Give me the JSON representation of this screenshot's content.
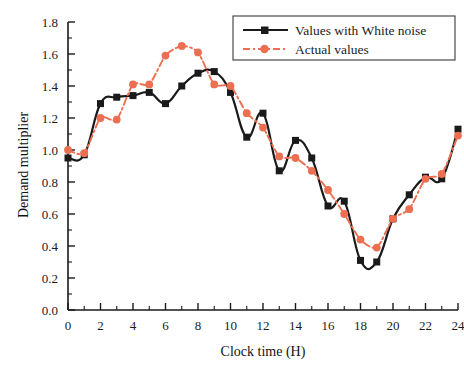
{
  "chart_data": {
    "type": "line",
    "title": "",
    "xlabel": "Clock time (H)",
    "ylabel": "Demand multiplier",
    "xlim": [
      0,
      24
    ],
    "ylim": [
      0.0,
      1.8
    ],
    "xticks": [
      0,
      2,
      4,
      6,
      8,
      10,
      12,
      14,
      16,
      18,
      20,
      22,
      24
    ],
    "xtick_labels": [
      "0",
      "2",
      "4",
      "6",
      "8",
      "10",
      "12",
      "14",
      "16",
      "18",
      "20",
      "22",
      "24"
    ],
    "xminor_ticks": [
      1,
      3,
      5,
      7,
      9,
      11,
      13,
      15,
      17,
      19,
      21,
      23
    ],
    "yticks": [
      0.0,
      0.2,
      0.4,
      0.6,
      0.8,
      1.0,
      1.2,
      1.4,
      1.6,
      1.8
    ],
    "ytick_labels": [
      "0.0",
      "0.2",
      "0.4",
      "0.6",
      "0.8",
      "1.0",
      "1.2",
      "1.4",
      "1.6",
      "1.8"
    ],
    "yminor_ticks": [
      0.1,
      0.3,
      0.5,
      0.7,
      0.9,
      1.1,
      1.3,
      1.5,
      1.7
    ],
    "grid": false,
    "legend_position": "top-right",
    "x": [
      0,
      1,
      2,
      3,
      4,
      5,
      6,
      7,
      8,
      9,
      10,
      11,
      12,
      13,
      14,
      15,
      16,
      17,
      18,
      19,
      20,
      21,
      22,
      23,
      24
    ],
    "series": [
      {
        "name": "Values with White noise",
        "color": "#1a1a1a",
        "marker": "square",
        "linestyle": "solid",
        "values": [
          0.95,
          0.97,
          1.29,
          1.33,
          1.34,
          1.36,
          1.29,
          1.4,
          1.48,
          1.49,
          1.36,
          1.08,
          1.23,
          0.87,
          1.06,
          0.95,
          0.65,
          0.68,
          0.31,
          0.3,
          0.57,
          0.72,
          0.83,
          0.82,
          1.13
        ]
      },
      {
        "name": "Actual values",
        "color": "#ec6f51",
        "marker": "circle",
        "linestyle": "dashdot",
        "values": [
          1.0,
          0.98,
          1.2,
          1.19,
          1.41,
          1.41,
          1.59,
          1.65,
          1.61,
          1.41,
          1.4,
          1.23,
          1.14,
          0.96,
          0.95,
          0.87,
          0.75,
          0.6,
          0.44,
          0.39,
          0.57,
          0.63,
          0.82,
          0.85,
          1.09
        ]
      }
    ]
  },
  "legend": {
    "items": [
      {
        "label": "Values with White noise"
      },
      {
        "label": "Actual values"
      }
    ]
  }
}
